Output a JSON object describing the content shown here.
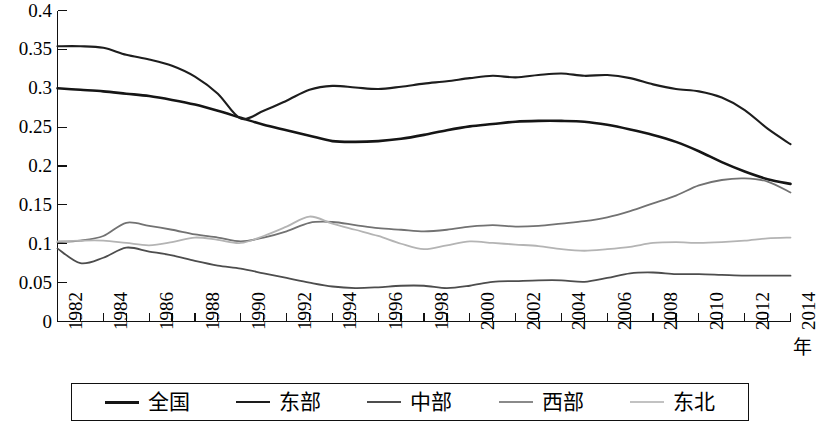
{
  "chart_data": {
    "type": "line",
    "title": "",
    "subtitle": "",
    "xlabel": "年",
    "ylabel": "",
    "grid": false,
    "legend_position": "bottom",
    "xlim": [
      1982,
      2014
    ],
    "ylim": [
      0,
      0.4
    ],
    "y_ticks": [
      "0",
      "0.05",
      "0.1",
      "0.15",
      "0.2",
      "0.25",
      "0.3",
      "0.35",
      "0.4"
    ],
    "y_tick_values": [
      0,
      0.05,
      0.1,
      0.15,
      0.2,
      0.25,
      0.3,
      0.35,
      0.4
    ],
    "x_tick_labels": [
      "1982",
      "1984",
      "1986",
      "1988",
      "1990",
      "1992",
      "1994",
      "1996",
      "1998",
      "2000",
      "2002",
      "2004",
      "2006",
      "2008",
      "2010",
      "2012",
      "2014"
    ],
    "x": [
      1982,
      1983,
      1984,
      1985,
      1986,
      1987,
      1988,
      1989,
      1990,
      1991,
      1992,
      1993,
      1994,
      1995,
      1996,
      1997,
      1998,
      1999,
      2000,
      2001,
      2002,
      2003,
      2004,
      2005,
      2006,
      2007,
      2008,
      2009,
      2010,
      2011,
      2012,
      2013,
      2014
    ],
    "series": [
      {
        "name": "全国",
        "color": "#151515",
        "width": 2.6,
        "values": [
          0.3,
          0.298,
          0.296,
          0.293,
          0.29,
          0.285,
          0.279,
          0.271,
          0.262,
          0.253,
          0.246,
          0.239,
          0.232,
          0.231,
          0.232,
          0.235,
          0.24,
          0.246,
          0.251,
          0.254,
          0.257,
          0.258,
          0.258,
          0.257,
          0.253,
          0.247,
          0.24,
          0.231,
          0.219,
          0.205,
          0.193,
          0.183,
          0.177
        ]
      },
      {
        "name": "东部",
        "color": "#1d1d1d",
        "width": 2.1,
        "values": [
          0.354,
          0.354,
          0.352,
          0.343,
          0.337,
          0.329,
          0.315,
          0.293,
          0.261,
          0.271,
          0.284,
          0.298,
          0.303,
          0.301,
          0.299,
          0.302,
          0.306,
          0.309,
          0.313,
          0.316,
          0.314,
          0.317,
          0.319,
          0.316,
          0.317,
          0.313,
          0.305,
          0.299,
          0.296,
          0.288,
          0.272,
          0.248,
          0.228
        ]
      },
      {
        "name": "中部",
        "color": "#4d4d4d",
        "width": 1.8,
        "values": [
          0.094,
          0.075,
          0.082,
          0.095,
          0.09,
          0.085,
          0.078,
          0.072,
          0.068,
          0.062,
          0.056,
          0.05,
          0.045,
          0.043,
          0.044,
          0.046,
          0.046,
          0.043,
          0.046,
          0.051,
          0.052,
          0.053,
          0.053,
          0.051,
          0.056,
          0.062,
          0.063,
          0.061,
          0.061,
          0.06,
          0.059,
          0.059,
          0.059
        ]
      },
      {
        "name": "西部",
        "color": "#727272",
        "width": 1.8,
        "values": [
          0.102,
          0.104,
          0.11,
          0.127,
          0.123,
          0.118,
          0.112,
          0.108,
          0.103,
          0.108,
          0.116,
          0.127,
          0.128,
          0.124,
          0.12,
          0.118,
          0.116,
          0.118,
          0.122,
          0.124,
          0.122,
          0.123,
          0.126,
          0.129,
          0.134,
          0.142,
          0.152,
          0.162,
          0.175,
          0.182,
          0.184,
          0.18,
          0.166
        ]
      },
      {
        "name": "东北",
        "color": "#b4b4b4",
        "width": 1.8,
        "values": [
          0.103,
          0.104,
          0.104,
          0.101,
          0.098,
          0.102,
          0.108,
          0.105,
          0.101,
          0.11,
          0.122,
          0.135,
          0.126,
          0.118,
          0.11,
          0.1,
          0.093,
          0.098,
          0.103,
          0.101,
          0.099,
          0.097,
          0.093,
          0.091,
          0.093,
          0.096,
          0.101,
          0.102,
          0.101,
          0.102,
          0.104,
          0.107,
          0.108
        ]
      }
    ]
  },
  "legend": {
    "items": [
      {
        "label": "全国",
        "color": "#151515",
        "width": 3.4
      },
      {
        "label": "东部",
        "color": "#1d1d1d",
        "width": 2.6
      },
      {
        "label": "中部",
        "color": "#4d4d4d",
        "width": 2.0
      },
      {
        "label": "西部",
        "color": "#8a8a8a",
        "width": 2.0
      },
      {
        "label": "东北",
        "color": "#c2c2c2",
        "width": 2.0
      }
    ]
  }
}
